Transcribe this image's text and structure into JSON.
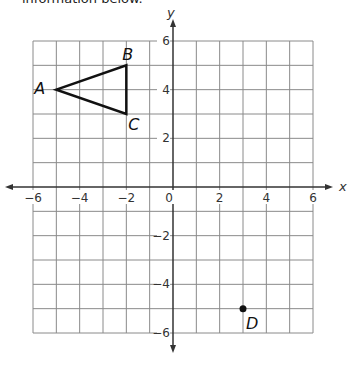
{
  "caption": "information below.",
  "axes": {
    "x_label": "x",
    "y_label": "y",
    "x_ticks": [
      {
        "value": -6,
        "label": "−6"
      },
      {
        "value": -4,
        "label": "−4"
      },
      {
        "value": -2,
        "label": "−2"
      },
      {
        "value": 0,
        "label": "0"
      },
      {
        "value": 2,
        "label": "2"
      },
      {
        "value": 4,
        "label": "4"
      },
      {
        "value": 6,
        "label": "6"
      }
    ],
    "y_ticks": [
      {
        "value": 6,
        "label": "6"
      },
      {
        "value": 4,
        "label": "4"
      },
      {
        "value": 2,
        "label": "2"
      },
      {
        "value": -2,
        "label": "−2"
      },
      {
        "value": -4,
        "label": "−4"
      },
      {
        "value": -6,
        "label": "−6"
      }
    ],
    "range": {
      "xmin": -6,
      "xmax": 6,
      "ymin": -6,
      "ymax": 6
    }
  },
  "triangle": {
    "vertices": [
      {
        "name": "A",
        "x": -5,
        "y": 4
      },
      {
        "name": "B",
        "x": -2,
        "y": 5
      },
      {
        "name": "C",
        "x": -2,
        "y": 3
      }
    ]
  },
  "points": [
    {
      "name": "D",
      "x": 3,
      "y": -5
    }
  ],
  "colors": {
    "grid": "#8a8a8a",
    "axis": "#333333",
    "shape": "#111111"
  }
}
